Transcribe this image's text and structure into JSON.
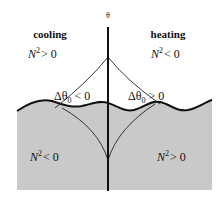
{
  "diagram": {
    "axis_label": "θ",
    "left_region": {
      "title": "cooling",
      "upper_condition": {
        "symbol": "N",
        "exp": "2",
        "rel": "> 0"
      },
      "lower_condition": {
        "symbol": "N",
        "exp": "2",
        "rel": "< 0"
      },
      "delta_label": {
        "prefix": "Δθ",
        "sub": "0",
        "rel": " < 0"
      }
    },
    "right_region": {
      "title": "heating",
      "upper_condition": {
        "symbol": "N",
        "exp": "2",
        "rel": "< 0"
      },
      "lower_condition": {
        "symbol": "N",
        "exp": "2",
        "rel": "> 0"
      },
      "delta_label": {
        "prefix": "Δθ",
        "sub": "0",
        "rel": " > 0"
      }
    },
    "colors": {
      "shade": "#c9c9c9",
      "line": "#111111",
      "background": "#ffffff"
    }
  }
}
